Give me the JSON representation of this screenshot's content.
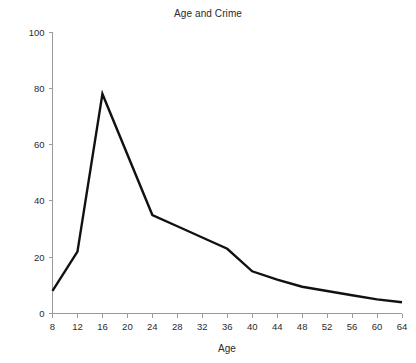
{
  "chart_data": {
    "type": "line",
    "title": "Age and Crime",
    "xlabel": "Age",
    "ylabel": "Crime Rate",
    "x": [
      8,
      12,
      16,
      24,
      28,
      32,
      36,
      40,
      44,
      48,
      52,
      56,
      60,
      64
    ],
    "values": [
      8,
      22,
      78,
      35,
      31,
      27,
      23,
      15,
      12,
      9.5,
      8,
      6.5,
      5,
      4
    ],
    "series": [
      {
        "name": "Crime Rate",
        "values": [
          8,
          22,
          78,
          35,
          31,
          27,
          23,
          15,
          12,
          9.5,
          8,
          6.5,
          5,
          4
        ]
      }
    ],
    "xlim": [
      8,
      64
    ],
    "ylim": [
      0,
      100
    ],
    "xticks": [
      8,
      12,
      16,
      20,
      24,
      28,
      32,
      36,
      40,
      44,
      48,
      52,
      56,
      60,
      64
    ],
    "xtick_labels": [
      "8",
      "12",
      "16",
      "20",
      "24",
      "28",
      "32",
      "36",
      "40",
      "44",
      "48",
      "52",
      "56",
      "60",
      "64"
    ],
    "yticks": [
      0,
      20,
      40,
      60,
      80,
      100
    ],
    "ytick_labels": [
      "0",
      "20",
      "40",
      "60",
      "80",
      "100"
    ],
    "grid": false,
    "legend": false,
    "legend_position": "none",
    "line_color": "#111111",
    "axis_color": "#9a9a9a",
    "background": "#ffffff"
  }
}
